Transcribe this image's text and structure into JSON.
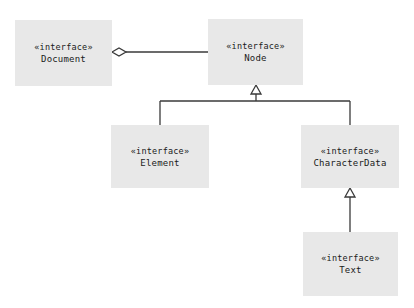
{
  "diagram": {
    "type": "uml-class-diagram",
    "background_color": "#ffffff",
    "box_fill_color": "#e8e8e8",
    "line_color": "#3a3a3a",
    "text_color": "#1a1a1a",
    "stereotype_text": "«interface»",
    "classes": [
      {
        "id": "document",
        "name": "Document",
        "stereotype": "«interface»"
      },
      {
        "id": "node",
        "name": "Node",
        "stereotype": "«interface»"
      },
      {
        "id": "element",
        "name": "Element",
        "stereotype": "«interface»"
      },
      {
        "id": "characterdata",
        "name": "CharacterData",
        "stereotype": "«interface»"
      },
      {
        "id": "text",
        "name": "Text",
        "stereotype": "«interface»"
      }
    ],
    "relationships": [
      {
        "kind": "aggregation",
        "whole": "Document",
        "part": "Node",
        "marker": "hollow-diamond"
      },
      {
        "kind": "generalization",
        "child": "Element",
        "parent": "Node",
        "marker": "hollow-triangle"
      },
      {
        "kind": "generalization",
        "child": "CharacterData",
        "parent": "Node",
        "marker": "hollow-triangle"
      },
      {
        "kind": "generalization",
        "child": "Text",
        "parent": "CharacterData",
        "marker": "hollow-triangle"
      }
    ]
  }
}
